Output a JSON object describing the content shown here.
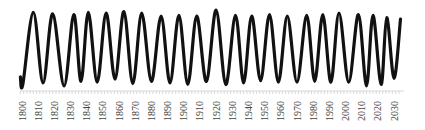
{
  "chart_data": {
    "type": "line",
    "title": "",
    "xlabel": "",
    "ylabel": "",
    "xlim": [
      1799,
      2035
    ],
    "ylim": [
      0,
      1
    ],
    "grid": false,
    "legend": null,
    "line_color": "#111111",
    "tick_labels": [
      "1800",
      "1810",
      "1820",
      "1830",
      "1840",
      "1850",
      "1860",
      "1870",
      "1880",
      "1890",
      "1900",
      "1910",
      "1920",
      "1930",
      "1940",
      "1950",
      "1960",
      "1970",
      "1980",
      "1990",
      "2000",
      "2010",
      "2020",
      "2030"
    ],
    "series": [
      {
        "name": "cycle",
        "x": [
          1799,
          1800.5,
          1807,
          1813,
          1819,
          1826,
          1832,
          1836.5,
          1841,
          1846.5,
          1852,
          1857.5,
          1863,
          1868.5,
          1874,
          1880,
          1886,
          1891.5,
          1897,
          1902.5,
          1908,
          1914,
          1920,
          1926,
          1932,
          1937,
          1942,
          1947.5,
          1953,
          1958.5,
          1964,
          1970,
          1976,
          1981,
          1986,
          1991,
          1996,
          2002,
          2008,
          2013,
          2017,
          2022,
          2025.5,
          2030,
          2034
        ],
        "values": [
          0.12,
          0.02,
          0.97,
          0.04,
          0.95,
          0.0,
          0.94,
          0.06,
          0.97,
          0.05,
          0.96,
          0.09,
          0.98,
          0.03,
          0.96,
          0.06,
          0.92,
          0.04,
          0.93,
          0.02,
          0.92,
          0.06,
          1.0,
          0.02,
          0.93,
          0.04,
          0.92,
          0.07,
          0.94,
          0.05,
          0.92,
          0.05,
          0.93,
          0.06,
          0.94,
          0.05,
          0.96,
          0.05,
          0.94,
          0.0,
          0.93,
          0.02,
          0.9,
          0.1,
          0.88
        ]
      }
    ]
  }
}
